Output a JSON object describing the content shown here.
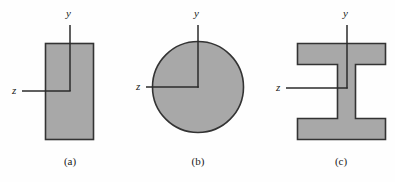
{
  "figure": {
    "background_color": "#fefefe",
    "fill_color": "#a8a8a8",
    "stroke_color": "#333333",
    "axis_color": "#2b2b2b",
    "text_color": "#1a1a1a",
    "panels": [
      {
        "id": "panel-a",
        "caption": "(a)",
        "shape": "rectangle",
        "y_axis_label": "y",
        "z_axis_label": "z"
      },
      {
        "id": "panel-b",
        "caption": "(b)",
        "shape": "circle",
        "y_axis_label": "y",
        "z_axis_label": "z"
      },
      {
        "id": "panel-c",
        "caption": "(c)",
        "shape": "i-beam",
        "y_axis_label": "y",
        "z_axis_label": "z"
      }
    ]
  }
}
